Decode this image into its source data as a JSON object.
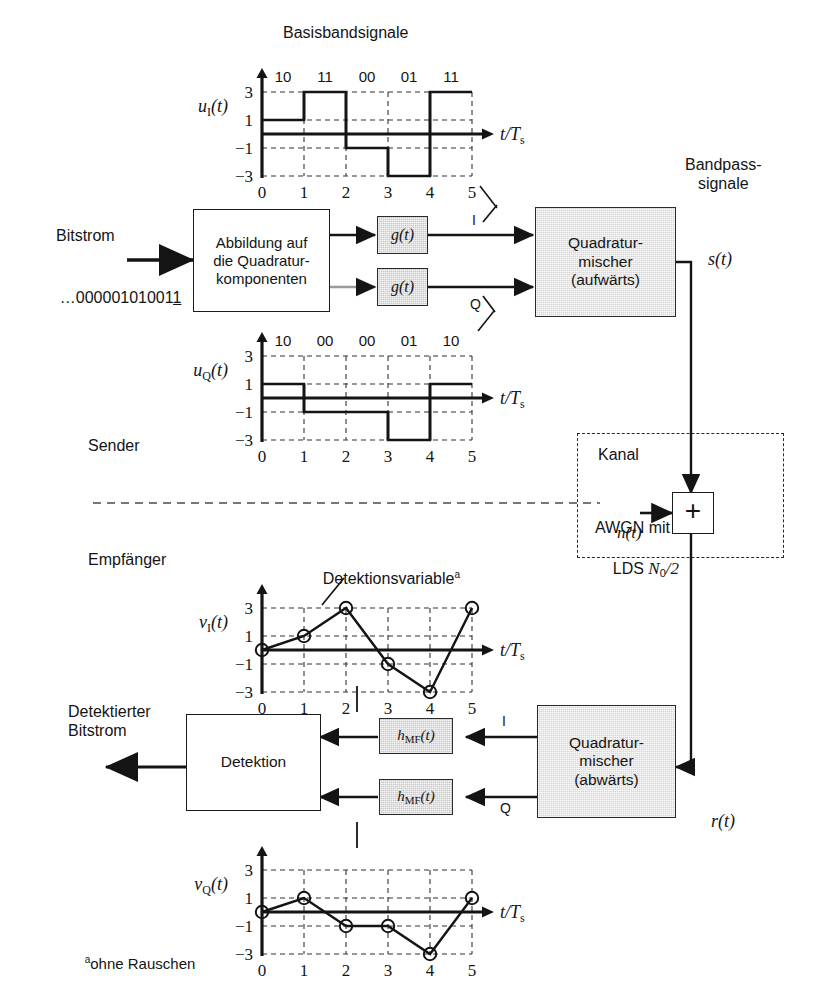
{
  "figure": {
    "title_top": "Basisbandsignale",
    "title_right": "Bandpass-\nsignale",
    "section_sender": "Sender",
    "section_empfaenger": "Empfänger",
    "footnote": "ohne Rauschen",
    "footnote_marker": "a",
    "annotation_detektionsvariable": "Detektionsvariable",
    "annotation_detektionsvariable_marker": "a"
  },
  "labels": {
    "bitstrom": "Bitstrom",
    "bitstrom_value": "…00000101001",
    "bitstrom_value_underlined": "1",
    "detektierter_bitstrom": "Detektierter\nBitstrom",
    "signal_s": "s(t)",
    "signal_r": "r(t)",
    "signal_n": "n(t)",
    "branch_I": "I",
    "branch_Q": "Q",
    "branch_I_rx": "I",
    "branch_Q_rx": "Q"
  },
  "blocks": {
    "mapper": "Abbildung auf\ndie Quadratur-\nkomponenten",
    "pulse_i": "g(t)",
    "pulse_q": "g(t)",
    "mixer_up": "Quadratur-\nmischer\n(aufwärts)",
    "mixer_down": "Quadratur-\nmischer\n(abwärts)",
    "channel_title": "Kanal",
    "channel_desc_1": "AWGN mit",
    "channel_desc_2": "LDS N₀/2",
    "summer_symbol": "+",
    "mf_i": "hMF(t)",
    "mf_q": "hMF(t)",
    "detection": "Detektion"
  },
  "chart_data": [
    {
      "id": "u_I",
      "type": "step",
      "ylabel": "u_I(t)",
      "xlabel": "t/T_s",
      "x": [
        0,
        1,
        2,
        3,
        4,
        5
      ],
      "xticks": [
        "0",
        "1",
        "2",
        "3",
        "4",
        "5"
      ],
      "yticks": [
        "3",
        "1",
        "-1",
        "-3"
      ],
      "ylim": [
        -3,
        3
      ],
      "xlim": [
        0,
        5
      ],
      "values": [
        1,
        3,
        -1,
        -3,
        3
      ],
      "bit_labels": [
        "10",
        "11",
        "00",
        "01",
        "11"
      ],
      "grid": true
    },
    {
      "id": "u_Q",
      "type": "step",
      "ylabel": "u_Q(t)",
      "xlabel": "t/T_s",
      "x": [
        0,
        1,
        2,
        3,
        4,
        5
      ],
      "xticks": [
        "0",
        "1",
        "2",
        "3",
        "4",
        "5"
      ],
      "yticks": [
        "3",
        "1",
        "-1",
        "-3"
      ],
      "ylim": [
        -3,
        3
      ],
      "xlim": [
        0,
        5
      ],
      "values": [
        1,
        -1,
        -1,
        -3,
        1
      ],
      "bit_labels": [
        "10",
        "00",
        "00",
        "01",
        "10"
      ],
      "grid": true
    },
    {
      "id": "v_I",
      "type": "line",
      "ylabel": "v_I(t)",
      "xlabel": "t/T_s",
      "x": [
        0,
        1,
        2,
        3,
        4,
        5
      ],
      "xticks": [
        "0",
        "1",
        "2",
        "3",
        "4",
        "5"
      ],
      "yticks": [
        "3",
        "1",
        "-1",
        "-3"
      ],
      "ylim": [
        -3,
        3
      ],
      "xlim": [
        0,
        5
      ],
      "values": [
        0,
        1,
        3,
        -1,
        -3,
        3
      ],
      "markers": true,
      "grid": true
    },
    {
      "id": "v_Q",
      "type": "line",
      "ylabel": "v_Q(t)",
      "xlabel": "t/T_s",
      "x": [
        0,
        1,
        2,
        3,
        4,
        5
      ],
      "xticks": [
        "0",
        "1",
        "2",
        "3",
        "4",
        "5"
      ],
      "yticks": [
        "3",
        "1",
        "-1",
        "-3"
      ],
      "ylim": [
        -3,
        3
      ],
      "xlim": [
        0,
        5
      ],
      "values": [
        0,
        1,
        -1,
        -1,
        -3,
        1
      ],
      "markers": true,
      "grid": true
    }
  ],
  "colors": {
    "ink": "#141414",
    "gray_fill": "#c9c9c9",
    "light_gray_fill": "#d6d6d6",
    "paper": "#ffffff"
  }
}
